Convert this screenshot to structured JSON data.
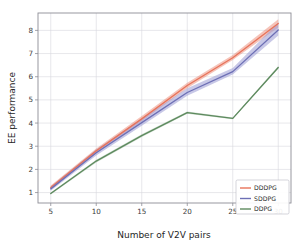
{
  "chart_data": {
    "type": "line",
    "title": "",
    "xlabel": "Number of V2V pairs",
    "ylabel": "EE performance",
    "x": [
      5,
      10,
      15,
      20,
      25,
      30
    ],
    "xlim": [
      3.6,
      31.4
    ],
    "ylim": [
      0.55,
      8.75
    ],
    "xticks": [
      5,
      10,
      15,
      20,
      25,
      30
    ],
    "yticks": [
      1,
      2,
      3,
      4,
      5,
      6,
      7,
      8
    ],
    "xtick_labels": [
      "5",
      "10",
      "15",
      "20",
      "25",
      "30"
    ],
    "ytick_labels": [
      "1",
      "2",
      "3",
      "4",
      "5",
      "6",
      "7",
      "8"
    ],
    "grid": true,
    "legend_position": "lower right",
    "series": [
      {
        "name": "DDDPG",
        "color": "#e8735a",
        "band_color": "#e8735a",
        "band_opacity": 0.42,
        "values": [
          1.22,
          2.8,
          4.18,
          5.62,
          6.82,
          8.3
        ],
        "band_low": [
          1.14,
          2.7,
          4.08,
          5.5,
          6.72,
          8.12
        ],
        "band_high": [
          1.3,
          2.9,
          4.3,
          5.74,
          6.94,
          8.48
        ]
      },
      {
        "name": "SDDPG",
        "color": "#6d6fb5",
        "band_color": "#9a9ad4",
        "band_opacity": 0.55,
        "values": [
          1.16,
          2.72,
          4.02,
          5.32,
          6.22,
          8.02
        ],
        "band_low": [
          1.08,
          2.6,
          3.88,
          5.18,
          6.1,
          7.78
        ],
        "band_high": [
          1.26,
          2.86,
          4.2,
          5.5,
          6.38,
          8.34
        ]
      },
      {
        "name": "DDPG",
        "color": "#5d8a5e",
        "band_color": "#5d8a5e",
        "band_opacity": 0.3,
        "values": [
          0.96,
          2.36,
          3.46,
          4.45,
          4.2,
          6.4
        ],
        "band_low": [
          0.92,
          2.3,
          3.4,
          4.4,
          4.16,
          6.34
        ],
        "band_high": [
          1.0,
          2.42,
          3.52,
          4.5,
          4.24,
          6.46
        ]
      }
    ],
    "legend_entries": [
      "DDDPG",
      "SDDPG",
      "DDPG"
    ]
  },
  "figure": {
    "background_color": "#ffffff",
    "axes_background_color": "#ffffff",
    "grid_color": "#d6d6de",
    "spine_color": "#8d8d95"
  }
}
